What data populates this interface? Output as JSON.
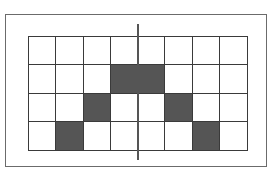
{
  "diagram": {
    "type": "grid-pattern",
    "rows": 4,
    "cols": 8,
    "fill_color": "#555555",
    "line_color": "#3a3a3a",
    "frame_color": "#6b6b6b",
    "filled_cells": [
      [
        1,
        3
      ],
      [
        1,
        4
      ],
      [
        2,
        2
      ],
      [
        2,
        5
      ],
      [
        3,
        1
      ],
      [
        3,
        6
      ]
    ],
    "symmetry_axis": "vertical-center"
  }
}
